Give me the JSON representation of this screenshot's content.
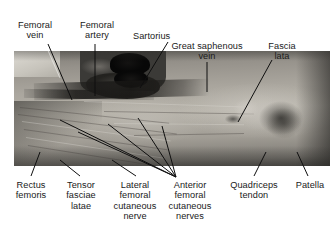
{
  "figure": {
    "type": "anatomical-photograph",
    "region": "anterior right thigh dissection",
    "image_box": {
      "x": 14,
      "y": 51,
      "width": 316,
      "height": 115
    }
  },
  "labels": {
    "femoral_vein": "Femoral\nvein",
    "femoral_artery": "Femoral\nartery",
    "sartorius": "Sartorius",
    "great_saphenous_vein": "Great saphenous\nvein",
    "fascia_lata": "Fascia\nlata",
    "rectus_femoris": "Rectus\nfemoris",
    "tensor_fasciae_latae": "Tensor\nfasciae\nlatae",
    "lateral_femoral_cutaneous_nerve": "Lateral\nfemoral\ncutaneous\nnerve",
    "anterior_femoral_cutaneous_nerves": "Anterior\nfemoral\ncutaneous\nnerves",
    "quadriceps_tendon": "Quadriceps\ntendon",
    "patella": "Patella"
  },
  "colors": {
    "background": "#ffffff",
    "text": "#1a1a1a",
    "leader_dark": "#111111",
    "leader_light": "#f2f2f2"
  }
}
